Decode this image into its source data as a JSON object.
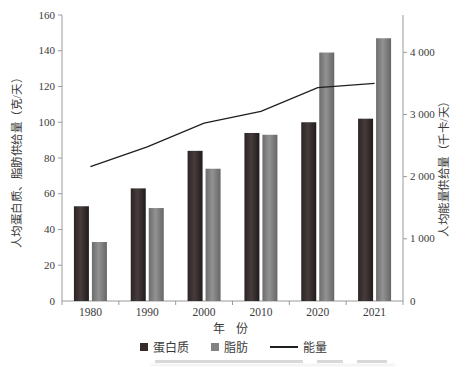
{
  "chart_data": {
    "type": "bar",
    "categories": [
      "1980",
      "1990",
      "2000",
      "2010",
      "2020",
      "2021"
    ],
    "series": [
      {
        "name": "蛋白质",
        "type": "bar",
        "axis": "left",
        "values": [
          53,
          63,
          84,
          94,
          100,
          102
        ],
        "color": "#352c2c"
      },
      {
        "name": "脂肪",
        "type": "bar",
        "axis": "left",
        "values": [
          33,
          52,
          74,
          93,
          139,
          147
        ],
        "color": "#828282"
      },
      {
        "name": "能量",
        "type": "line",
        "axis": "right",
        "values": [
          2160,
          2480,
          2860,
          3050,
          3430,
          3500
        ],
        "color": "#1f1f1f"
      }
    ],
    "left_axis": {
      "title": "人均蛋白质、脂肪供给量（克/天）",
      "ylim": [
        0,
        160
      ],
      "tick_step": 20,
      "tick_labels": [
        "0",
        "20",
        "40",
        "60",
        "80",
        "100",
        "120",
        "140",
        "160"
      ]
    },
    "right_axis": {
      "title": "人均能量供给量（千卡/天）",
      "ylim": [
        0,
        4600
      ],
      "ticks": [
        0,
        1000,
        2000,
        3000,
        4000
      ],
      "tick_labels": [
        "0",
        "1 000",
        "2 000",
        "3 000",
        "4 000"
      ]
    },
    "x_axis": {
      "title": "年 份"
    },
    "legend_position": "bottom",
    "grid": false,
    "legend": [
      {
        "label": "蛋白质",
        "swatch": "square",
        "color": "#352c2c"
      },
      {
        "label": "脂肪",
        "swatch": "square",
        "color": "#828282"
      },
      {
        "label": "能量",
        "swatch": "line",
        "color": "#1f1f1f"
      }
    ]
  }
}
